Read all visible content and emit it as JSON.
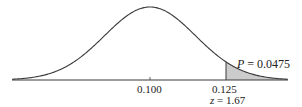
{
  "chart_data": {
    "type": "area",
    "title": "",
    "distribution": {
      "mean": 0.1,
      "z_cutoff": 1.67,
      "cutoff_value": 0.125
    },
    "xlabel": "",
    "ylabel": "",
    "x_ticks": [
      "0.100",
      "0.125"
    ],
    "shaded_region": {
      "from": 0.125,
      "to": "infinity",
      "probability": 0.0475
    },
    "annotations": {
      "p_label_var": "P",
      "p_label_eq": " = 0.0475",
      "mean_label": "0.100",
      "cutoff_label": "0.125",
      "z_label_var": "z",
      "z_label_eq": " = 1.67"
    },
    "grid": false,
    "legend": null,
    "colors": {
      "curve": "#3a3a3a",
      "shade": "#cccccc",
      "axis": "#3a3a3a"
    }
  }
}
